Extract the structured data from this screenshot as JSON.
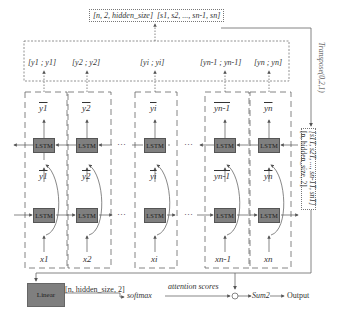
{
  "diagram": {
    "top_box": {
      "shape": "[n, 2, hidden_size]",
      "sequence": "[s1, s2, ..., sn-1, sn]"
    },
    "transpose_label": "Transpose(0,2,1)",
    "side_box": {
      "sequence": "[s1T, s2T, ..., sn-1T, snT]",
      "shape": "[n, hidden_size, 2]"
    },
    "concat_pairs": [
      {
        "label": "[y1 ; y1]"
      },
      {
        "label": "[y2 ; y2]"
      },
      {
        "label": "[yi ; yi]"
      },
      {
        "label": "[yn-1 ; yn-1]"
      },
      {
        "label": "[yn ; yn]"
      }
    ],
    "columns": [
      {
        "backward_output": "y1",
        "forward_output": "y1",
        "input": "x1"
      },
      {
        "backward_output": "y2",
        "forward_output": "y2",
        "input": "x2"
      },
      {
        "backward_output": "yi",
        "forward_output": "yi",
        "input": "xi"
      },
      {
        "backward_output": "yn-1",
        "forward_output": "yn-1",
        "input": "xn-1"
      },
      {
        "backward_output": "yn",
        "forward_output": "yn",
        "input": "xn"
      }
    ],
    "lstm_label": "LSTM",
    "ellipsis": "···",
    "linear_label": "Linear",
    "linear_output_shape": "[n, hidden_size, 2]",
    "softmax_label": "softmax",
    "attention_label": "attention scores",
    "product_symbol": "⊙",
    "sum_label": "Sum2",
    "output_label": "Output"
  }
}
